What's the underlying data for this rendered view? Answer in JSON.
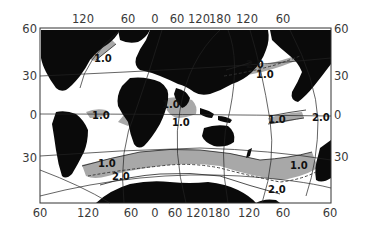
{
  "map": {
    "type": "world-ocean-contour-map",
    "projection": "rotated graticule (oblique)",
    "colors": {
      "land": "#0a0a0a",
      "shaded_region": "#a8a8a8",
      "ocean": "#ffffff",
      "lines": "#222222",
      "text": "#3a3a3a"
    },
    "axes": {
      "top_ticks": [
        "120",
        "60",
        "0",
        "60",
        "120",
        "180",
        "120",
        "60"
      ],
      "bottom_ticks": [
        "60",
        "120",
        "60",
        "0",
        "60",
        "120",
        "180",
        "120",
        "60",
        "60"
      ],
      "left_ticks": [
        "60",
        "30",
        "0",
        "30",
        "60"
      ],
      "right_ticks": [
        "60",
        "30",
        "0",
        "30",
        "60"
      ]
    },
    "contour_labels": [
      {
        "id": "n-atlantic",
        "text": "1.0"
      },
      {
        "id": "n-pacific-20",
        "text": "2.0"
      },
      {
        "id": "n-pacific-10",
        "text": "1.0"
      },
      {
        "id": "eq-atlantic",
        "text": "1.0"
      },
      {
        "id": "eq-atlantic-2",
        "text": "1.0"
      },
      {
        "id": "indian",
        "text": "1.0"
      },
      {
        "id": "e-pacific-10",
        "text": "1.0"
      },
      {
        "id": "e-pacific-20",
        "text": "2.0"
      },
      {
        "id": "s-atlantic-10",
        "text": "1.0"
      },
      {
        "id": "s-atlantic-20",
        "text": "2.0"
      },
      {
        "id": "s-pacific-10",
        "text": "1.0"
      },
      {
        "id": "s-pacific-20",
        "text": "2.0"
      }
    ]
  }
}
